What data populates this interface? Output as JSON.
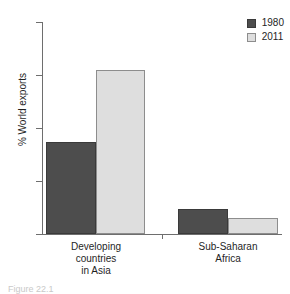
{
  "chart_data": {
    "type": "bar",
    "title": "",
    "xlabel": "",
    "ylabel": "% World exports",
    "ylim": [
      0,
      40
    ],
    "yticks": [
      0,
      10,
      20,
      30,
      40
    ],
    "ytick_labels": [
      "0",
      "10",
      "20",
      "30",
      "40"
    ],
    "grid": false,
    "legend_position": "top-right",
    "categories": [
      "Developing\ncountries\nin Asia",
      "Sub-Saharan\nAfrica"
    ],
    "series": [
      {
        "name": "1980",
        "color": "#4d4d4d",
        "values": [
          17.3,
          4.7
        ]
      },
      {
        "name": "2011",
        "color": "#dedede",
        "values": [
          30.9,
          3.0
        ]
      }
    ]
  },
  "legend": {
    "items": [
      {
        "label": "1980",
        "swatch": "dark-swatch-icon"
      },
      {
        "label": "2011",
        "swatch": "light-swatch-icon"
      }
    ]
  },
  "caption": {
    "text": "Figure 22.1"
  }
}
